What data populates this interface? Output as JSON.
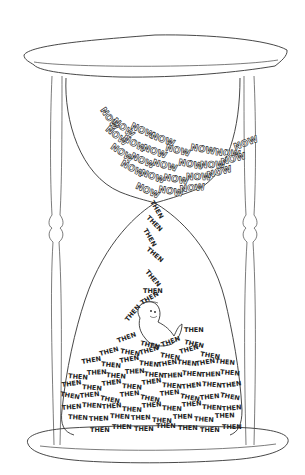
{
  "illustration": {
    "subject": "hourglass",
    "top_word": "NOW",
    "bottom_word": "THEN",
    "colors": {
      "ink": "#222222",
      "background": "#ffffff"
    },
    "top_words": [
      {
        "x": 100,
        "y": 110,
        "r": 55
      },
      {
        "x": 112,
        "y": 122,
        "r": 40
      },
      {
        "x": 130,
        "y": 128,
        "r": 25
      },
      {
        "x": 150,
        "y": 138,
        "r": 20
      },
      {
        "x": 105,
        "y": 130,
        "r": 40
      },
      {
        "x": 122,
        "y": 140,
        "r": 30
      },
      {
        "x": 142,
        "y": 150,
        "r": 20
      },
      {
        "x": 165,
        "y": 150,
        "r": 15
      },
      {
        "x": 190,
        "y": 150,
        "r": 10
      },
      {
        "x": 215,
        "y": 155,
        "r": 5
      },
      {
        "x": 235,
        "y": 150,
        "r": -20
      },
      {
        "x": 110,
        "y": 148,
        "r": 35
      },
      {
        "x": 130,
        "y": 158,
        "r": 25
      },
      {
        "x": 152,
        "y": 165,
        "r": 15
      },
      {
        "x": 178,
        "y": 165,
        "r": 10
      },
      {
        "x": 200,
        "y": 168,
        "r": 0
      },
      {
        "x": 222,
        "y": 165,
        "r": -15
      },
      {
        "x": 120,
        "y": 165,
        "r": 30
      },
      {
        "x": 140,
        "y": 175,
        "r": 20
      },
      {
        "x": 163,
        "y": 180,
        "r": 10
      },
      {
        "x": 186,
        "y": 180,
        "r": 0
      },
      {
        "x": 208,
        "y": 178,
        "r": -15
      },
      {
        "x": 135,
        "y": 188,
        "r": 25
      },
      {
        "x": 158,
        "y": 192,
        "r": 10
      },
      {
        "x": 180,
        "y": 192,
        "r": -5
      }
    ],
    "falling_words": [
      {
        "x": 150,
        "y": 202,
        "r": 60
      },
      {
        "x": 146,
        "y": 218,
        "r": 45
      },
      {
        "x": 143,
        "y": 230,
        "r": 60
      },
      {
        "x": 146,
        "y": 250,
        "r": 40
      },
      {
        "x": 145,
        "y": 272,
        "r": 50
      },
      {
        "x": 143,
        "y": 293,
        "r": 0
      },
      {
        "x": 142,
        "y": 305,
        "r": -30
      },
      {
        "x": 128,
        "y": 322,
        "r": -50
      },
      {
        "x": 184,
        "y": 332,
        "r": 0
      }
    ],
    "pile_rows": [
      {
        "y": 345,
        "x0": 118,
        "count": 4,
        "gap": 22,
        "rot": -20
      },
      {
        "y": 355,
        "x0": 100,
        "count": 6,
        "gap": 20,
        "rot": -15
      },
      {
        "y": 365,
        "x0": 82,
        "count": 8,
        "gap": 19,
        "rot": -10
      },
      {
        "y": 376,
        "x0": 68,
        "count": 9,
        "gap": 19,
        "rot": 5
      },
      {
        "y": 387,
        "x0": 62,
        "count": 9,
        "gap": 20,
        "rot": -8
      },
      {
        "y": 398,
        "x0": 60,
        "count": 9,
        "gap": 20,
        "rot": 10
      },
      {
        "y": 409,
        "x0": 62,
        "count": 9,
        "gap": 20,
        "rot": -5
      },
      {
        "y": 420,
        "x0": 68,
        "count": 8,
        "gap": 21,
        "rot": 3
      },
      {
        "y": 430,
        "x0": 90,
        "count": 7,
        "gap": 22,
        "rot": 0
      }
    ]
  }
}
